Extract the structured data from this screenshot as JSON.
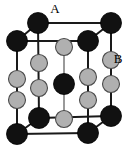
{
  "figure": {
    "background_color": "#ffffff",
    "width": 130,
    "height": 150
  },
  "labels": [
    {
      "id": "label-a",
      "text": "A",
      "x": 55,
      "y": 13,
      "target_site": "top-back-left-corner"
    },
    {
      "id": "label-b",
      "text": "B",
      "x": 118,
      "y": 63,
      "target_site": "right-front-edge-upper"
    }
  ],
  "legend": {
    "species": [
      {
        "name": "A",
        "role": "corner-atom",
        "fill": "#111111",
        "stroke": "#000000",
        "radius": 9.5
      },
      {
        "name": "B",
        "role": "edge-atom",
        "fill": "#b0b0b0",
        "stroke": "#4a4a4a",
        "radius": 8.0
      }
    ]
  },
  "bonds": {
    "stroke": "#1a1a1a",
    "stroke_width": 2.0,
    "light_stroke": "#9a9a9a",
    "light_stroke_width": 2.0
  },
  "atoms": [
    {
      "id": "a-top-back-left",
      "species": "A",
      "x": 38,
      "y": 23,
      "r": 10.5,
      "layer": "back-top"
    },
    {
      "id": "a-top-back-right",
      "species": "A",
      "x": 111,
      "y": 23,
      "r": 10.5,
      "layer": "back-top"
    },
    {
      "id": "a-top-front-left",
      "species": "A",
      "x": 17,
      "y": 41,
      "r": 10.5,
      "layer": "front-top"
    },
    {
      "id": "a-top-front-right",
      "species": "A",
      "x": 88,
      "y": 41,
      "r": 10.5,
      "layer": "front-top"
    },
    {
      "id": "b-top-center-back",
      "species": "B",
      "x": 64,
      "y": 47,
      "r": 8.5,
      "layer": "mid-back"
    },
    {
      "id": "b-col2-upper",
      "species": "B",
      "x": 39,
      "y": 63,
      "r": 8.5,
      "layer": "mid-back"
    },
    {
      "id": "b-col5-upper",
      "species": "B",
      "x": 111,
      "y": 60,
      "r": 8.5,
      "layer": "mid-back"
    },
    {
      "id": "b-col1-upper",
      "species": "B",
      "x": 17,
      "y": 79,
      "r": 8.5,
      "layer": "mid-front"
    },
    {
      "id": "b-col4-upper",
      "species": "B",
      "x": 88,
      "y": 77,
      "r": 8.5,
      "layer": "mid-front"
    },
    {
      "id": "a-body-center",
      "species": "A",
      "x": 64,
      "y": 84,
      "r": 10.5,
      "layer": "mid-core"
    },
    {
      "id": "b-col2-lower",
      "species": "B",
      "x": 39,
      "y": 88,
      "r": 8.5,
      "layer": "mid-back"
    },
    {
      "id": "b-col5-lower",
      "species": "B",
      "x": 111,
      "y": 84,
      "r": 8.5,
      "layer": "mid-back"
    },
    {
      "id": "b-col1-lower",
      "species": "B",
      "x": 17,
      "y": 100,
      "r": 8.5,
      "layer": "mid-front"
    },
    {
      "id": "b-col4-lower",
      "species": "B",
      "x": 88,
      "y": 100,
      "r": 8.5,
      "layer": "mid-front"
    },
    {
      "id": "b-bottom-center",
      "species": "B",
      "x": 64,
      "y": 119,
      "r": 8.5,
      "layer": "mid-front"
    },
    {
      "id": "a-bot-back-left",
      "species": "A",
      "x": 39,
      "y": 118,
      "r": 10.5,
      "layer": "back-bottom"
    },
    {
      "id": "a-bot-back-right",
      "species": "A",
      "x": 111,
      "y": 116,
      "r": 10.5,
      "layer": "back-bottom"
    },
    {
      "id": "a-bot-front-left",
      "species": "A",
      "x": 17,
      "y": 134,
      "r": 10.5,
      "layer": "front-bottom"
    },
    {
      "id": "a-bot-front-right",
      "species": "A",
      "x": 88,
      "y": 133,
      "r": 10.5,
      "layer": "front-bottom"
    }
  ],
  "edges": [
    {
      "from": "a-top-back-left",
      "to": "a-top-back-right",
      "style": "dark"
    },
    {
      "from": "a-top-front-left",
      "to": "a-top-front-right",
      "style": "dark"
    },
    {
      "from": "a-top-front-left",
      "to": "a-top-back-left",
      "style": "dark"
    },
    {
      "from": "a-top-front-right",
      "to": "a-top-back-right",
      "style": "dark"
    },
    {
      "from": "a-bot-back-left",
      "to": "a-bot-back-right",
      "style": "dark"
    },
    {
      "from": "a-bot-front-left",
      "to": "a-bot-front-right",
      "style": "dark"
    },
    {
      "from": "a-bot-front-left",
      "to": "a-bot-back-left",
      "style": "dark"
    },
    {
      "from": "a-bot-front-right",
      "to": "a-bot-back-right",
      "style": "dark"
    },
    {
      "from": "a-top-back-left",
      "to": "a-bot-back-left",
      "style": "dark"
    },
    {
      "from": "a-top-back-right",
      "to": "a-bot-back-right",
      "style": "dark"
    },
    {
      "from": "a-top-front-left",
      "to": "a-bot-front-left",
      "style": "dark"
    },
    {
      "from": "a-top-front-right",
      "to": "a-bot-front-right",
      "style": "dark"
    },
    {
      "from": "b-top-center-back",
      "to": "b-bottom-center",
      "style": "light"
    }
  ]
}
